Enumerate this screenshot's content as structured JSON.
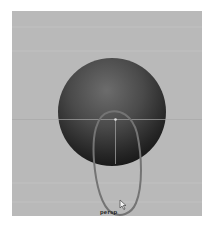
{
  "viewport": {
    "camera_label": "persp",
    "background_color": "#b9b9b9",
    "grid_color": "#d0d0d0"
  },
  "scene": {
    "objects": [
      {
        "type": "sphere",
        "name": "sphere",
        "color_top": "#6a6a6a",
        "color_bottom": "#151515"
      },
      {
        "type": "curve",
        "name": "ellipse-curve",
        "stroke_color": "#747474"
      }
    ],
    "pivot": {
      "color": "#e0e0e0"
    }
  },
  "cursor": {
    "icon": "arrow-cursor-icon"
  }
}
